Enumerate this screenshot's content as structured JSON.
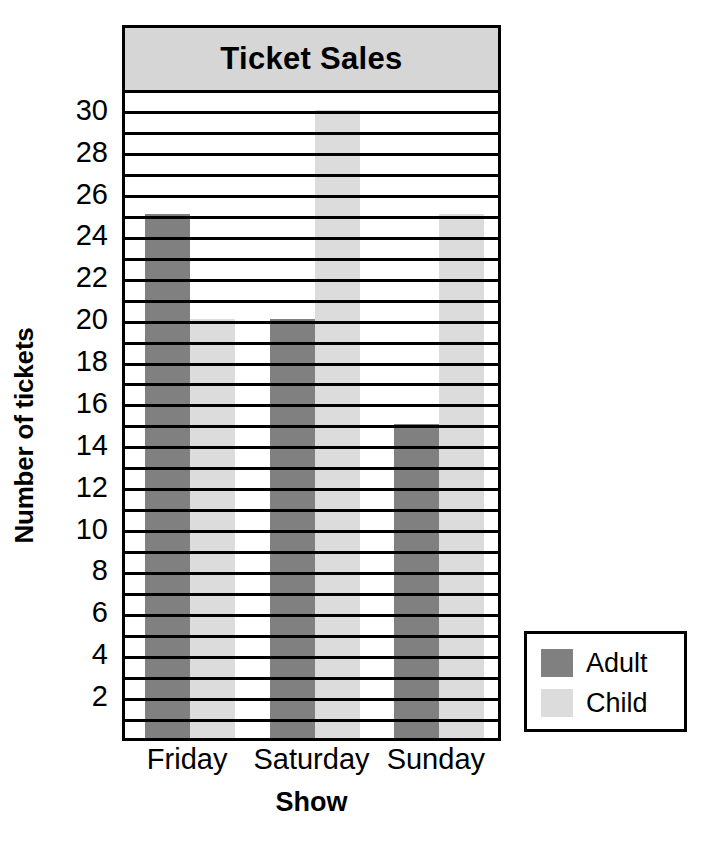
{
  "chart_data": {
    "type": "bar",
    "title": "Ticket Sales",
    "xlabel": "Show",
    "ylabel": "Number of tickets",
    "categories": [
      "Friday",
      "Saturday",
      "Sunday"
    ],
    "series": [
      {
        "name": "Adult",
        "color": "#808080",
        "values": [
          25,
          20,
          15
        ]
      },
      {
        "name": "Child",
        "color": "#dcdcdc",
        "values": [
          20,
          30,
          25
        ]
      }
    ],
    "ylim": [
      0,
      30.8
    ],
    "y_tick_labels": [
      2,
      4,
      6,
      8,
      10,
      12,
      14,
      16,
      18,
      20,
      22,
      24,
      26,
      28,
      30
    ],
    "gridline_values": [
      1,
      2,
      3,
      4,
      5,
      6,
      7,
      8,
      9,
      10,
      11,
      12,
      13,
      14,
      15,
      16,
      17,
      18,
      19,
      20,
      21,
      22,
      23,
      24,
      25,
      26,
      27,
      28,
      29,
      30
    ],
    "grid": true,
    "legend_position": "bottom-right",
    "legend_entries": [
      "Adult",
      "Child"
    ]
  },
  "colors": {
    "adult": "#808080",
    "child": "#dcdcdc",
    "title_bar_background": "#d6d6d6",
    "frame_border": "#000000",
    "plot_background": "#ffffff"
  }
}
